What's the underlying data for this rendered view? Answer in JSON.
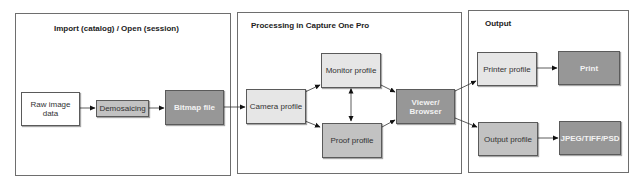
{
  "panels": [
    {
      "id": "import",
      "title": "Import (catalog) / Open (session)"
    },
    {
      "id": "processing",
      "title": "Processing in Capture One Pro"
    },
    {
      "id": "output",
      "title": "Output"
    }
  ],
  "nodes": {
    "raw_image_data": "Raw image data",
    "demosaicing": "Demosaicing",
    "bitmap_file": "Bitmap file",
    "camera_profile": "Camera profile",
    "monitor_profile": "Monitor profile",
    "proof_profile": "Proof profile",
    "viewer_browser": "Viewer/ Browser",
    "printer_profile": "Printer profile",
    "print": "Print",
    "output_profile": "Output profile",
    "jpeg_tiff_psd": "JPEG/TIFF/PSD"
  },
  "edges": [
    [
      "raw_image_data",
      "demosaicing"
    ],
    [
      "demosaicing",
      "bitmap_file"
    ],
    [
      "bitmap_file",
      "camera_profile"
    ],
    [
      "camera_profile",
      "monitor_profile"
    ],
    [
      "camera_profile",
      "proof_profile"
    ],
    [
      "monitor_profile",
      "proof_profile",
      "bidirectional"
    ],
    [
      "monitor_profile",
      "viewer_browser"
    ],
    [
      "proof_profile",
      "viewer_browser"
    ],
    [
      "viewer_browser",
      "printer_profile"
    ],
    [
      "viewer_browser",
      "output_profile"
    ],
    [
      "printer_profile",
      "print"
    ],
    [
      "output_profile",
      "jpeg_tiff_psd"
    ]
  ],
  "colors": {
    "border": "#6e6e6e",
    "white_node": "#ffffff",
    "light_node": "#e6e6e6",
    "mid_node": "#c2c2c2",
    "dark_node": "#979797"
  }
}
